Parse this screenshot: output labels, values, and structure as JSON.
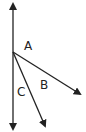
{
  "diagram": {
    "type": "angles-at-a-point",
    "labels": {
      "A": "A",
      "B": "B",
      "C": "C"
    },
    "vertex": {
      "x": 13,
      "y": 52
    },
    "lines": [
      {
        "name": "vertical-line",
        "from": [
          13,
          3
        ],
        "to": [
          13,
          130
        ],
        "double_headed": true
      },
      {
        "name": "ray-b",
        "from": [
          13,
          52
        ],
        "to": [
          81,
          95
        ]
      },
      {
        "name": "ray-c",
        "from": [
          13,
          52
        ],
        "to": [
          46,
          127
        ]
      }
    ],
    "stroke_color": "#222222"
  }
}
